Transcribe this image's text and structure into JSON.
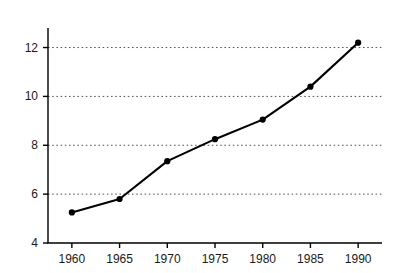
{
  "chart_data": {
    "type": "line",
    "title": "",
    "subtitle": "",
    "xlabel": "",
    "ylabel": "% GNP",
    "x": [
      1960,
      1965,
      1970,
      1975,
      1980,
      1985,
      1990
    ],
    "values": [
      5.25,
      5.8,
      7.35,
      8.25,
      9.05,
      10.4,
      12.2
    ],
    "series": [
      {
        "name": "% GNP",
        "values": [
          5.25,
          5.8,
          7.35,
          8.25,
          9.05,
          10.4,
          12.2
        ]
      }
    ],
    "xlim": [
      1957.5,
      1992.5
    ],
    "ylim": [
      4,
      12.8
    ],
    "xticks": [
      1960,
      1965,
      1970,
      1975,
      1980,
      1985,
      1990
    ],
    "xticklabels": [
      "1960",
      "1965",
      "1970",
      "1975",
      "1980",
      "1985",
      "1990"
    ],
    "yticks": [
      4,
      6,
      8,
      10,
      12
    ],
    "yticklabels": [
      "4",
      "6",
      "8",
      "10",
      "12"
    ],
    "gridlines_y": [
      6,
      8,
      10,
      12
    ],
    "grid": "horizontal-dotted",
    "legend": "none",
    "marker": "filled-circle",
    "line_color": "#000000",
    "marker_color": "#000000",
    "grid_color": "#555555",
    "axis_color": "#000000",
    "background_color": "#ffffff",
    "annotations": []
  }
}
